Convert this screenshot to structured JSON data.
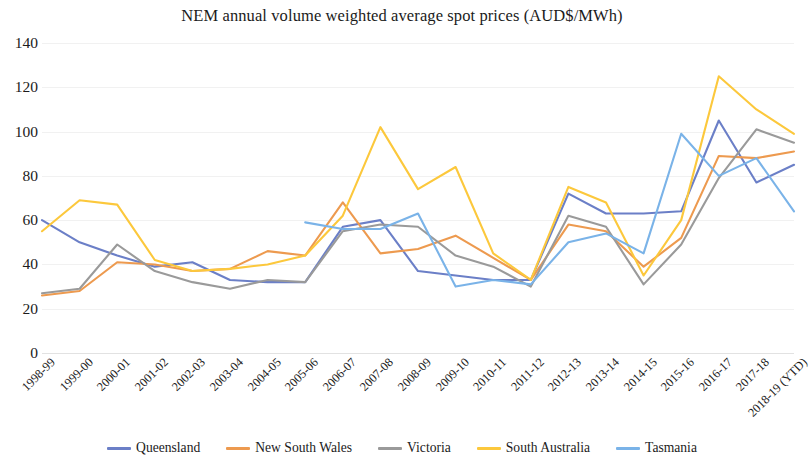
{
  "chart_data": {
    "type": "line",
    "title": "NEM annual volume weighted average spot prices (AUD$/MWh)",
    "xlabel": "",
    "ylabel": "",
    "ylim": [
      0,
      140
    ],
    "yticks": [
      0,
      20,
      40,
      60,
      80,
      100,
      120,
      140
    ],
    "grid": true,
    "legend_position": "bottom",
    "categories": [
      "1998-99",
      "1999-00",
      "2000-01",
      "2001-02",
      "2002-03",
      "2003-04",
      "2004-05",
      "2005-06",
      "2006-07",
      "2007-08",
      "2008-09",
      "2009-10",
      "2010-11",
      "2011-12",
      "2012-13",
      "2013-14",
      "2014-15",
      "2015-16",
      "2016-17",
      "2017-18",
      "2018-19 (YTD)"
    ],
    "series": [
      {
        "name": "Queensland",
        "color": "#6b7fc7",
        "values": [
          60,
          50,
          44,
          39,
          41,
          33,
          32,
          32,
          57,
          60,
          37,
          35,
          33,
          33,
          72,
          63,
          63,
          64,
          105,
          77,
          85
        ]
      },
      {
        "name": "New South Wales",
        "color": "#ed9a4f",
        "values": [
          26,
          28,
          41,
          40,
          37,
          38,
          46,
          44,
          68,
          45,
          47,
          53,
          43,
          33,
          58,
          55,
          39,
          52,
          89,
          88,
          91
        ]
      },
      {
        "name": "Victoria",
        "color": "#9a9a9a",
        "values": [
          27,
          29,
          49,
          37,
          32,
          29,
          33,
          32,
          55,
          58,
          57,
          44,
          39,
          30,
          62,
          57,
          31,
          49,
          79,
          101,
          95
        ]
      },
      {
        "name": "South Australia",
        "color": "#fcc83c",
        "values": [
          55,
          69,
          67,
          42,
          37,
          38,
          40,
          44,
          62,
          102,
          74,
          84,
          45,
          33,
          75,
          68,
          35,
          60,
          125,
          110,
          99
        ]
      },
      {
        "name": "Tasmania",
        "color": "#7ab3e8",
        "values": [
          null,
          null,
          null,
          null,
          null,
          null,
          null,
          59,
          56,
          56,
          63,
          30,
          33,
          31,
          50,
          54,
          45,
          99,
          80,
          88,
          64
        ]
      }
    ]
  },
  "legend": {
    "items": [
      {
        "label": "Queensland",
        "color": "#6b7fc7"
      },
      {
        "label": "New South Wales",
        "color": "#ed9a4f"
      },
      {
        "label": "Victoria",
        "color": "#9a9a9a"
      },
      {
        "label": "South Australia",
        "color": "#fcc83c"
      },
      {
        "label": "Tasmania",
        "color": "#7ab3e8"
      }
    ]
  }
}
